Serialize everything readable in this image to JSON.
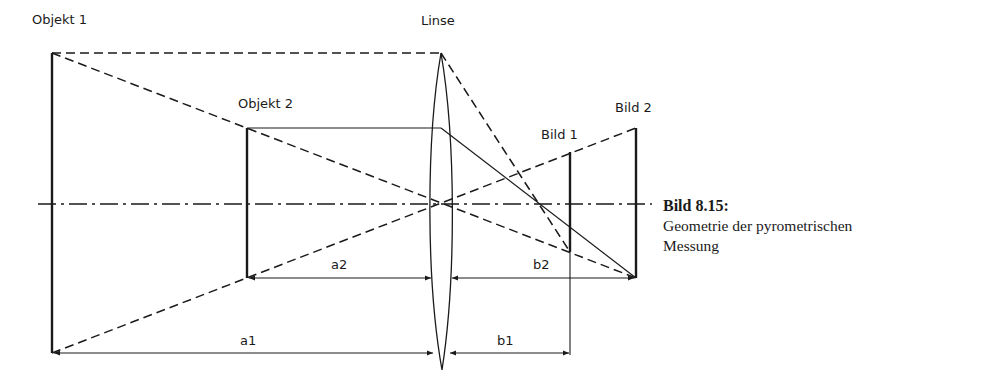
{
  "labels": {
    "objekt1": "Objekt 1",
    "objekt2": "Objekt 2",
    "linse": "Linse",
    "bild1": "Bild 1",
    "bild2": "Bild 2",
    "a1": "a1",
    "a2": "a2",
    "b1": "b1",
    "b2": "b2"
  },
  "caption": {
    "title": "Bild 8.15:",
    "line1": "Geometrie der pyrometrischen",
    "line2": "Messung"
  },
  "colors": {
    "ink": "#1a1a1a",
    "background": "#ffffff"
  }
}
